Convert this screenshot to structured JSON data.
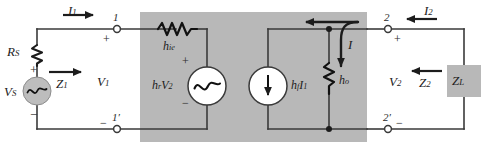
{
  "figure": {
    "type": "circuit-schematic",
    "background": "#ffffff",
    "block_fill": "#b8b8b8",
    "wire_color": "#3a3a3a",
    "shaded_block_label": "two-port h-parameter model region"
  },
  "source_network": {
    "source_label": "V",
    "source_sub": "S",
    "series_resistor_label": "R",
    "series_resistor_sub": "S",
    "input_impedance_label": "Z",
    "input_impedance_sub": "1",
    "polarity_plus": "+",
    "polarity_minus": "−"
  },
  "input_port": {
    "current_label": "I",
    "current_sub": "1",
    "voltage_label": "V",
    "voltage_sub": "1",
    "terminal_top": "1",
    "terminal_bottom": "1′",
    "terminal_top_polarity": "+",
    "terminal_bottom_polarity": "−"
  },
  "model": {
    "series_impedance_label": "h",
    "series_impedance_sub": "ie",
    "voltage_source_label": "h",
    "voltage_source_sub": "r",
    "voltage_source_multiplier": "V",
    "voltage_source_multiplier_sub": "2",
    "voltage_source_plus": "+",
    "voltage_source_minus": "−",
    "current_source_label": "h",
    "current_source_sub": "f",
    "current_source_multiplier": "I",
    "current_source_multiplier_sub": "1",
    "output_admittance_label": "h",
    "output_admittance_sub": "o",
    "branch_current_label": "I"
  },
  "output_port": {
    "current_label": "I",
    "current_sub": "2",
    "voltage_label": "V",
    "voltage_sub": "2",
    "terminal_top": "2",
    "terminal_bottom": "2′",
    "terminal_top_polarity": "+",
    "terminal_bottom_polarity": "−"
  },
  "load_network": {
    "output_impedance_label": "Z",
    "output_impedance_sub": "2",
    "load_label": "Z",
    "load_sub": "L"
  }
}
